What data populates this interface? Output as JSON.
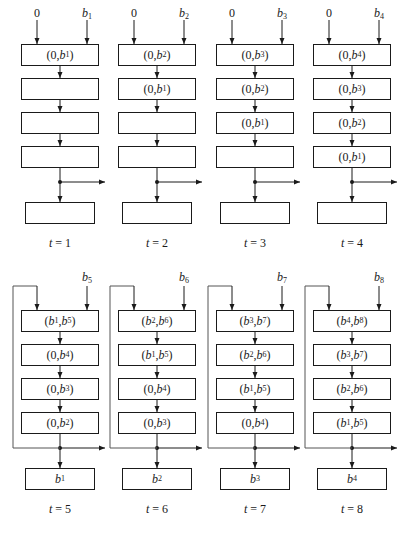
{
  "figure": {
    "line_color": "#1a1a1a",
    "feedback_line_color": "#555555"
  },
  "top_row": [
    {
      "t_label": "t = 1",
      "left_input": "0",
      "right_input": "b1",
      "cells": [
        "(0, b1)",
        "",
        "",
        ""
      ],
      "output": ""
    },
    {
      "t_label": "t = 2",
      "left_input": "0",
      "right_input": "b2",
      "cells": [
        "(0, b2)",
        "(0, b1)",
        "",
        ""
      ],
      "output": ""
    },
    {
      "t_label": "t = 3",
      "left_input": "0",
      "right_input": "b3",
      "cells": [
        "(0, b3)",
        "(0, b2)",
        "(0, b1)",
        ""
      ],
      "output": ""
    },
    {
      "t_label": "t = 4",
      "left_input": "0",
      "right_input": "b4",
      "cells": [
        "(0, b4)",
        "(0, b3)",
        "(0, b2)",
        "(0, b1)"
      ],
      "output": ""
    }
  ],
  "bottom_row": [
    {
      "t_label": "t = 5",
      "left_input": "feedback",
      "right_input": "b5",
      "cells": [
        "(b1, b5)",
        "(0, b4)",
        "(0, b3)",
        "(0, b2)"
      ],
      "output": "b1"
    },
    {
      "t_label": "t = 6",
      "left_input": "feedback",
      "right_input": "b6",
      "cells": [
        "(b2, b6)",
        "(b1, b5)",
        "(0, b4)",
        "(0, b3)"
      ],
      "output": "b2"
    },
    {
      "t_label": "t = 7",
      "left_input": "feedback",
      "right_input": "b7",
      "cells": [
        "(b3, b7)",
        "(b2, b6)",
        "(b1, b5)",
        "(0, b4)"
      ],
      "output": "b3"
    },
    {
      "t_label": "t = 8",
      "left_input": "feedback",
      "right_input": "b8",
      "cells": [
        "(b4, b8)",
        "(b3, b7)",
        "(b2, b6)",
        "(b1, b5)"
      ],
      "output": "b4"
    }
  ]
}
